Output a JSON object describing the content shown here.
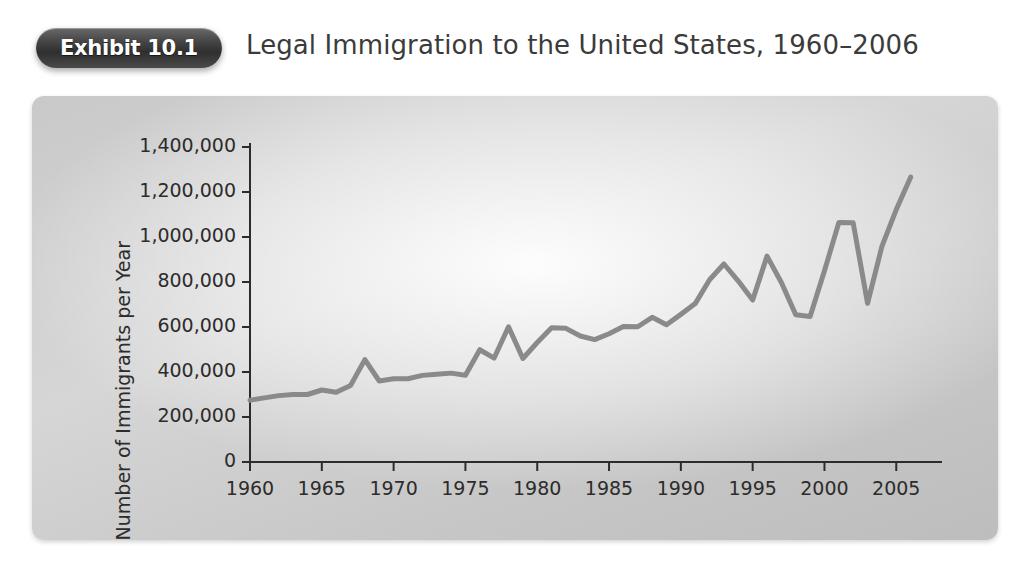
{
  "header": {
    "badge_label": "Exhibit 10.1",
    "title": "Legal Immigration to the United States, 1960–2006"
  },
  "chart_data": {
    "type": "line",
    "title": "Legal Immigration to the United States, 1960–2006",
    "xlabel": "",
    "ylabel": "Number of Immigrants per Year",
    "xlim": [
      1960,
      2007
    ],
    "ylim": [
      0,
      1400000
    ],
    "grid": false,
    "legend": "none",
    "line_color": "#8a8a8a",
    "axis_color": "#2c2c2c",
    "x_ticks": [
      1960,
      1965,
      1970,
      1975,
      1980,
      1985,
      1990,
      1995,
      2000,
      2005
    ],
    "x_tick_labels": [
      "1960",
      "1965",
      "1970",
      "1975",
      "1980",
      "1985",
      "1990",
      "1995",
      "2000",
      "2005"
    ],
    "y_ticks": [
      0,
      200000,
      400000,
      600000,
      800000,
      1000000,
      1200000,
      1400000
    ],
    "y_tick_labels": [
      "0",
      "200,000",
      "400,000",
      "600,000",
      "800,000",
      "1,000,000",
      "1,200,000",
      "1,400,000"
    ],
    "x": [
      1960,
      1961,
      1962,
      1963,
      1964,
      1965,
      1966,
      1967,
      1968,
      1969,
      1970,
      1971,
      1972,
      1973,
      1974,
      1975,
      1976,
      1977,
      1978,
      1979,
      1980,
      1981,
      1982,
      1983,
      1984,
      1985,
      1986,
      1987,
      1988,
      1989,
      1990,
      1991,
      1992,
      1993,
      1994,
      1995,
      1996,
      1997,
      1998,
      1999,
      2000,
      2001,
      2002,
      2003,
      2004,
      2005,
      2006
    ],
    "values": [
      275000,
      285000,
      295000,
      300000,
      300000,
      320000,
      310000,
      340000,
      455000,
      360000,
      370000,
      370000,
      385000,
      390000,
      395000,
      386000,
      499000,
      462000,
      601000,
      460000,
      531000,
      597000,
      594000,
      560000,
      544000,
      570000,
      602000,
      601000,
      643000,
      610000,
      656000,
      704000,
      810000,
      880000,
      804000,
      720000,
      915000,
      798000,
      654000,
      647000,
      850000,
      1064000,
      1063000,
      705000,
      958000,
      1122000,
      1266000
    ]
  }
}
